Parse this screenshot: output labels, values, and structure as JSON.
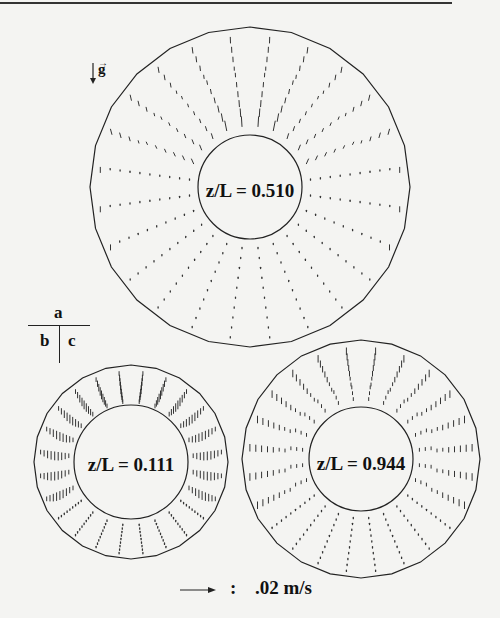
{
  "figure": {
    "gravity_label": "g",
    "panel_key": {
      "top": "a",
      "bottom_left": "b",
      "bottom_right": "c"
    },
    "panels": [
      {
        "id": "a",
        "label": "z/L = 0.510",
        "cx": 250,
        "cy": 187,
        "r_outer": 160,
        "r_inner": 52,
        "sides": 24,
        "style": "plume"
      },
      {
        "id": "b",
        "label": "z/L = 0.111",
        "cx": 131,
        "cy": 462,
        "r_outer": 97,
        "r_inner": 57,
        "sides": 24,
        "style": "dense"
      },
      {
        "id": "c",
        "label": "z/L = 0.944",
        "cx": 361,
        "cy": 459,
        "r_outer": 119,
        "r_inner": 52,
        "sides": 24,
        "style": "mixed"
      }
    ],
    "scale_bar": {
      "separator": ":",
      "value": ".02 m/s"
    }
  }
}
